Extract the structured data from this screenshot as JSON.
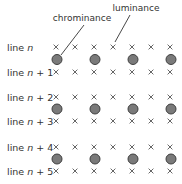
{
  "labels": {
    "chrominance": "chrominance",
    "luminance": "luminance"
  },
  "rows": [
    {
      "prefix": "line ",
      "var": "n",
      "suffix": ""
    },
    {
      "prefix": "line ",
      "var": "n",
      "suffix": " + 1"
    },
    {
      "prefix": "line ",
      "var": "n",
      "suffix": " + 2"
    },
    {
      "prefix": "line ",
      "var": "n",
      "suffix": " + 3"
    },
    {
      "prefix": "line ",
      "var": "n",
      "suffix": " + 4"
    },
    {
      "prefix": "line ",
      "var": "n",
      "suffix": " + 5"
    }
  ],
  "luma_per_line": 7,
  "chroma_rows_after_lines": [
    0,
    2,
    4
  ],
  "chroma_columns": [
    0,
    2,
    4,
    6
  ],
  "legend_symbols": {
    "luminance": "×",
    "chrominance": "filled-circle"
  },
  "colors": {
    "chroma_fill": "#7a7a7a",
    "chroma_stroke": "#3f3f3f",
    "luma_mark": "#555555",
    "text": "#333333"
  }
}
